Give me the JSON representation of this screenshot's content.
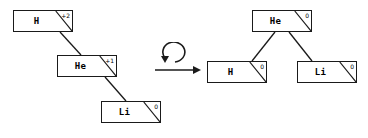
{
  "figure": {
    "stroke_color": "#1a1a1a",
    "text_color": "#000000",
    "background_color": "#ffffff"
  },
  "left_tree": {
    "name": "unbalanced-tree",
    "nodes": [
      {
        "id": "h",
        "label": "H",
        "balance_factor": "+2",
        "x": 13,
        "y": 10,
        "w": 60,
        "h": 22
      },
      {
        "id": "he",
        "label": "He",
        "balance_factor": "+1",
        "x": 57,
        "y": 55,
        "w": 60,
        "h": 22
      },
      {
        "id": "li",
        "label": "Li",
        "balance_factor": "0",
        "x": 101,
        "y": 101,
        "w": 60,
        "h": 22
      }
    ],
    "edges": [
      {
        "from": "h",
        "to": "he",
        "x1": 60,
        "y1": 32,
        "x2": 81,
        "y2": 55
      },
      {
        "from": "he",
        "to": "li",
        "x1": 105,
        "y1": 77,
        "x2": 126,
        "y2": 101
      }
    ]
  },
  "transform": {
    "name": "rotation-operator",
    "symbol": "rotate-ccw-arrow",
    "arrow": "rightwards-arrow",
    "arrow_label": "→"
  },
  "right_tree": {
    "name": "balanced-tree",
    "nodes": [
      {
        "id": "he",
        "label": "He",
        "balance_factor": "0",
        "x": 252,
        "y": 10,
        "w": 60,
        "h": 22
      },
      {
        "id": "h",
        "label": "H",
        "balance_factor": "0",
        "x": 207,
        "y": 61,
        "w": 60,
        "h": 22
      },
      {
        "id": "li",
        "label": "Li",
        "balance_factor": "0",
        "x": 297,
        "y": 61,
        "w": 60,
        "h": 22
      }
    ],
    "edges": [
      {
        "from": "he",
        "to": "h",
        "x1": 275,
        "y1": 32,
        "x2": 252,
        "y2": 61
      },
      {
        "from": "he",
        "to": "li",
        "x1": 289,
        "y1": 32,
        "x2": 312,
        "y2": 61
      }
    ]
  }
}
